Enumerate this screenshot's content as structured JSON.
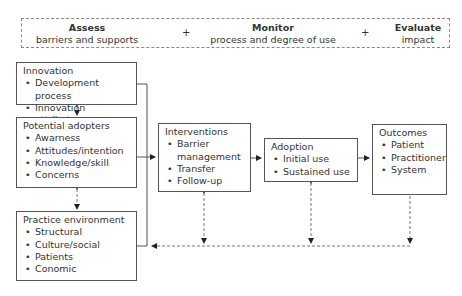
{
  "header": {
    "assess": {
      "title": "Assess",
      "subtitle": "barriers and supports"
    },
    "plus1": "+",
    "monitor": {
      "title": "Monitor",
      "subtitle": "process and degree of use"
    },
    "plus2": "+",
    "evaluate": {
      "title": "Evaluate",
      "subtitle": "impact"
    }
  },
  "boxes": {
    "innovation": {
      "title": "Innovation",
      "items": [
        "Development process",
        "Innovation attributes"
      ]
    },
    "adopters": {
      "title": "Potential adopters",
      "items": [
        "Awarness",
        "Attitudes/intention",
        "Knowledge/skill",
        "Concerns"
      ]
    },
    "environment": {
      "title": "Practice environment",
      "items": [
        "Structural",
        "Culture/social",
        "Patients",
        "Conomic"
      ]
    },
    "interventions": {
      "title": "Interventions",
      "items": [
        "Barrier management",
        "Transfer",
        "Follow-up"
      ]
    },
    "adoption": {
      "title": "Adoption",
      "items": [
        "Initial use",
        "Sustained use"
      ]
    },
    "outcomes": {
      "title": "Outcomes",
      "items": [
        "Patient",
        "Practitioner",
        "System"
      ]
    }
  }
}
